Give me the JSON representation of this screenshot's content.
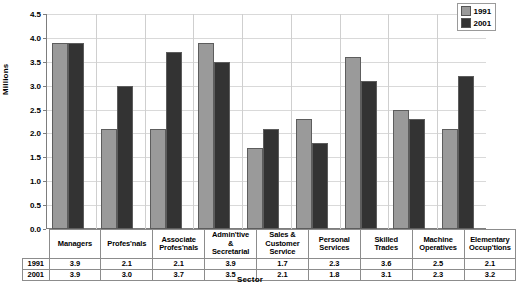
{
  "chart_data": {
    "type": "bar",
    "title": "",
    "xlabel": "Sector",
    "ylabel": "Millions",
    "ylim": [
      0.0,
      4.5
    ],
    "ytick_step": 0.5,
    "grid": true,
    "legend_position": "top-right",
    "categories": [
      "Managers",
      "Profes'nals",
      "Associate Profes'nals",
      "Admin'tive & Secretarial",
      "Sales & Customer Service",
      "Personal Services",
      "Skilled Trades",
      "Machine Operatives",
      "Elementary Occup'tions"
    ],
    "series": [
      {
        "name": "1991",
        "color": "#9a9a9a",
        "values": [
          3.9,
          2.1,
          2.1,
          3.9,
          1.7,
          2.3,
          3.6,
          2.5,
          2.1
        ]
      },
      {
        "name": "2001",
        "color": "#333333",
        "values": [
          3.9,
          3.0,
          3.7,
          3.5,
          2.1,
          1.8,
          3.1,
          2.3,
          3.2
        ]
      }
    ],
    "ytick_labels": [
      "0.0",
      "0.5",
      "1.0",
      "1.5",
      "2.0",
      "2.5",
      "3.0",
      "3.5",
      "4.0",
      "4.5"
    ]
  },
  "legend": {
    "items": [
      {
        "label": "1991",
        "color": "#9a9a9a"
      },
      {
        "label": "2001",
        "color": "#333333"
      }
    ]
  },
  "table": {
    "column_headers": [
      [
        "Managers"
      ],
      [
        "Profes'nals"
      ],
      [
        "Associate",
        "Profes'nals"
      ],
      [
        "Admin'tive",
        "&",
        "Secretarial"
      ],
      [
        "Sales &",
        "Customer",
        "Service"
      ],
      [
        "Personal",
        "Services"
      ],
      [
        "Skilled",
        "Trades"
      ],
      [
        "Machine",
        "Operatives"
      ],
      [
        "Elementary",
        "Occup'tions"
      ]
    ],
    "rows": [
      {
        "label": "1991",
        "values": [
          "3.9",
          "2.1",
          "2.1",
          "3.9",
          "1.7",
          "2.3",
          "3.6",
          "2.5",
          "2.1"
        ]
      },
      {
        "label": "2001",
        "values": [
          "3.9",
          "3.0",
          "3.7",
          "3.5",
          "2.1",
          "1.8",
          "3.1",
          "2.3",
          "3.2"
        ]
      }
    ]
  }
}
